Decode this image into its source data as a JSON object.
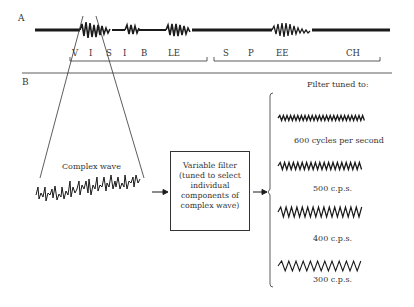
{
  "panel_a": {
    "label": "A",
    "segments_word1": [
      "V",
      "I",
      "S",
      "I",
      "B",
      "LE"
    ],
    "segments_word2": [
      "S",
      "P",
      "EE",
      "CH"
    ],
    "words": [
      "VISIBLE",
      "SPEECH"
    ]
  },
  "panel_b": {
    "label": "B",
    "complex_wave_label": "Complex wave",
    "filter_box": {
      "lines": [
        "Variable filter",
        "(tuned to select",
        "individual",
        "components of",
        "complex wave)"
      ]
    },
    "filter_tuned_label": "Filter tuned to:",
    "outputs": [
      {
        "frequency_label": "600 cycles per second",
        "hz": 600
      },
      {
        "frequency_label": "500 c.p.s.",
        "hz": 500
      },
      {
        "frequency_label": "400 c.p.s.",
        "hz": 400
      },
      {
        "frequency_label": "300 c.p.s.",
        "hz": 300
      }
    ]
  },
  "colors": {
    "ink": "#2a2a2a",
    "background": "#ffffff"
  }
}
